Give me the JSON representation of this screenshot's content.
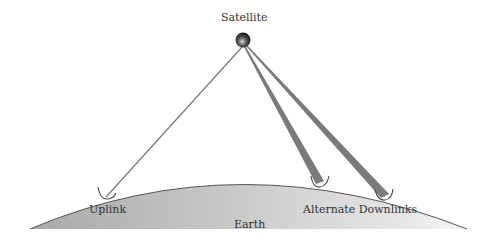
{
  "diagram": {
    "satellite_label": "Satellite",
    "earth_label": "Earth",
    "uplink_label": "Uplink",
    "downlinks_label": "Alternate Downlinks"
  },
  "colors": {
    "satellite": "#2a2a2a",
    "uplink_line": "#777777",
    "downlink_beam": "#7a7a7a",
    "earth_fill_light": "#f4f4f4",
    "earth_fill_dark": "#b8b8b8",
    "earth_outline": "#555555",
    "text": "#333333"
  }
}
